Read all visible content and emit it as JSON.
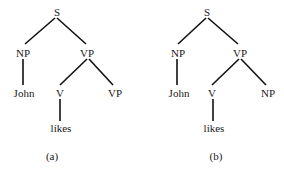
{
  "trees": [
    {
      "caption": "(a)",
      "nodes": {
        "root": "S",
        "subject": "NP",
        "predicate": "VP",
        "subject_word": "John",
        "verb": "V",
        "complement": "VP",
        "verb_word": "likes"
      }
    },
    {
      "caption": "(b)",
      "nodes": {
        "root": "S",
        "subject": "NP",
        "predicate": "VP",
        "subject_word": "John",
        "verb": "V",
        "complement": "NP",
        "verb_word": "likes"
      }
    }
  ]
}
